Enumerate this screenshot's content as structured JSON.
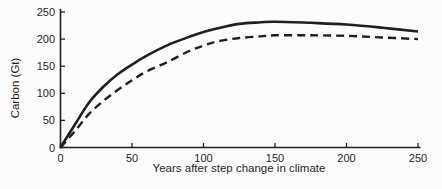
{
  "figure": {
    "background": "#fcfcfc",
    "ink_color": "#1f1f1f"
  },
  "chart_data": {
    "type": "line",
    "title": "",
    "xlabel": "Years after step change in climate",
    "ylabel": "Carbon (Gt)",
    "xlim": [
      0,
      250
    ],
    "ylim": [
      0,
      250
    ],
    "x_ticks": [
      0,
      50,
      100,
      150,
      200,
      250
    ],
    "y_ticks": [
      0,
      50,
      100,
      150,
      200,
      250
    ],
    "grid": false,
    "legend": "none",
    "x": [
      0,
      10,
      20,
      30,
      40,
      50,
      60,
      75,
      90,
      100,
      110,
      125,
      140,
      150,
      175,
      200,
      225,
      250
    ],
    "series": [
      {
        "name": "solid curve",
        "style": "solid",
        "stroke_width": 2.6,
        "values": [
          0,
          42,
          83,
          112,
          135,
          153,
          169,
          189,
          204,
          213,
          220,
          228,
          231,
          232,
          230,
          227,
          221,
          214
        ]
      },
      {
        "name": "dashed curve",
        "style": "dashed",
        "dash": [
          8,
          5
        ],
        "stroke_width": 2.4,
        "values": [
          0,
          30,
          62,
          86,
          106,
          124,
          140,
          158,
          178,
          188,
          196,
          202,
          205,
          207,
          207,
          206,
          203,
          200
        ]
      }
    ]
  }
}
